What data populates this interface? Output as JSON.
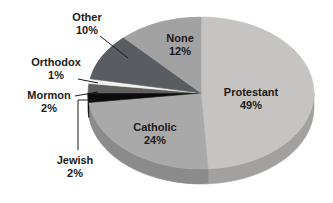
{
  "chart_data": {
    "type": "pie",
    "title": "",
    "start_angle_deg": 0,
    "direction": "clockwise",
    "style_3d": true,
    "background": "#ffffff",
    "text_color": "#1b1b1b",
    "leader_line_color": "#1b1b1b",
    "labels_outside": [
      "Other",
      "Orthodox",
      "Mormon",
      "Jewish"
    ],
    "labels_inside": [
      "Protestant",
      "Catholic",
      "None"
    ],
    "slices": [
      {
        "label": "Protestant",
        "value": 49,
        "pct_text": "49%",
        "color": "#c5c4c2"
      },
      {
        "label": "Catholic",
        "value": 24,
        "pct_text": "24%",
        "color": "#a9a9a9"
      },
      {
        "label": "Jewish",
        "value": 2,
        "pct_text": "2%",
        "color": "#0b0b0b"
      },
      {
        "label": "Mormon",
        "value": 2,
        "pct_text": "2%",
        "color": "#606060"
      },
      {
        "label": "Orthodox",
        "value": 1,
        "pct_text": "1%",
        "color": "#f3f2ee"
      },
      {
        "label": "Other",
        "value": 10,
        "pct_text": "10%",
        "color": "#595c60"
      },
      {
        "label": "None",
        "value": 12,
        "pct_text": "12%",
        "color": "#a2a2a2"
      }
    ]
  }
}
